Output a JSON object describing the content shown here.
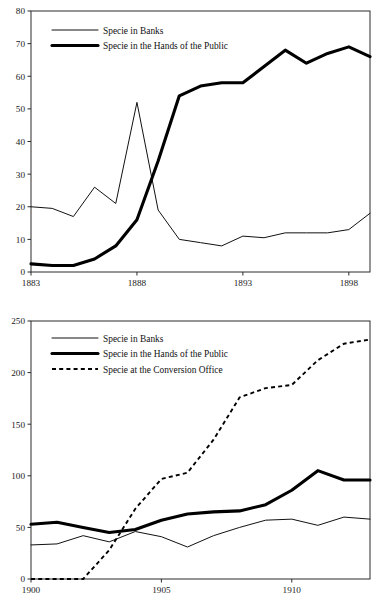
{
  "figure": {
    "caption": "",
    "background": "#ffffff",
    "ink": "#111111"
  },
  "chart_data": [
    {
      "id": "chart-top",
      "type": "line",
      "title": "",
      "subtitle": "",
      "xlabel": "",
      "ylabel": "",
      "xlim": [
        1883,
        1899
      ],
      "ylim": [
        0,
        80
      ],
      "yticks": [
        0,
        10,
        20,
        30,
        40,
        50,
        60,
        70,
        80
      ],
      "xticks": [
        1883,
        1888,
        1893,
        1898
      ],
      "xticklabels": [
        "1883",
        "1888",
        "1893",
        "1898"
      ],
      "yticklabels": [
        "0",
        "10",
        "20",
        "30",
        "40",
        "50",
        "60",
        "70",
        "80"
      ],
      "grid": false,
      "legend_position": "top-left",
      "x": [
        1883,
        1884,
        1885,
        1886,
        1887,
        1888,
        1889,
        1890,
        1891,
        1892,
        1893,
        1894,
        1895,
        1896,
        1897,
        1898,
        1899
      ],
      "series": [
        {
          "name": "Specie in Banks",
          "style": "thin-solid",
          "color": "#111111",
          "values": [
            20,
            19.5,
            17,
            26,
            21,
            52,
            19,
            10,
            9,
            8,
            11,
            10.5,
            12,
            12,
            12,
            13,
            18
          ]
        },
        {
          "name": "Specie in the Hands of the Public",
          "style": "thick-solid",
          "color": "#000000",
          "values": [
            2.5,
            2,
            2,
            4,
            8,
            16,
            34,
            54,
            57,
            58,
            58,
            63,
            68,
            64,
            67,
            69,
            66
          ]
        }
      ]
    },
    {
      "id": "chart-bottom",
      "type": "line",
      "title": "",
      "subtitle": "",
      "xlabel": "",
      "ylabel": "",
      "xlim": [
        1900,
        1913
      ],
      "ylim": [
        0,
        250
      ],
      "yticks": [
        0,
        50,
        100,
        150,
        200,
        250
      ],
      "xticks": [
        1900,
        1905,
        1910
      ],
      "xticklabels": [
        "1900",
        "1905",
        "1910"
      ],
      "yticklabels": [
        "0",
        "50",
        "100",
        "150",
        "200",
        "250"
      ],
      "grid": false,
      "legend_position": "top-left",
      "x": [
        1900,
        1901,
        1902,
        1903,
        1904,
        1905,
        1906,
        1907,
        1908,
        1909,
        1910,
        1911,
        1912,
        1913
      ],
      "series": [
        {
          "name": "Specie in Banks",
          "style": "thin-solid",
          "color": "#111111",
          "values": [
            33,
            34,
            42,
            36,
            46,
            41,
            31,
            42,
            50,
            57,
            58,
            52,
            60,
            58
          ]
        },
        {
          "name": "Specie in the Hands of the Public",
          "style": "thick-solid",
          "color": "#000000",
          "values": [
            53,
            55,
            50,
            45,
            48,
            57,
            63,
            65,
            66,
            72,
            86,
            105,
            96,
            96
          ]
        },
        {
          "name": "Specie at the Conversion Office",
          "style": "dashed",
          "color": "#000000",
          "values": [
            0,
            0,
            0,
            28,
            68,
            97,
            103,
            135,
            176,
            185,
            188,
            212,
            228,
            232
          ]
        }
      ]
    }
  ]
}
